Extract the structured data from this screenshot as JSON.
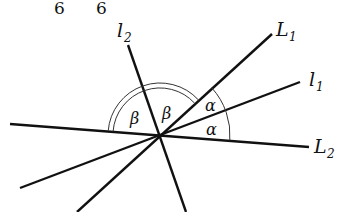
{
  "figure": {
    "top_fragments": [
      "6",
      "6"
    ],
    "lines": {
      "l1": {
        "label": "l",
        "sub": "1"
      },
      "l2": {
        "label": "l",
        "sub": "2"
      },
      "L1": {
        "label": "L",
        "sub": "1"
      },
      "L2": {
        "label": "L",
        "sub": "2"
      }
    },
    "angles": {
      "alpha_upper": "α",
      "alpha_lower": "α",
      "beta_left": "β",
      "beta_right": "β"
    },
    "colors": {
      "line": "#111111",
      "arc": "#333333"
    }
  }
}
